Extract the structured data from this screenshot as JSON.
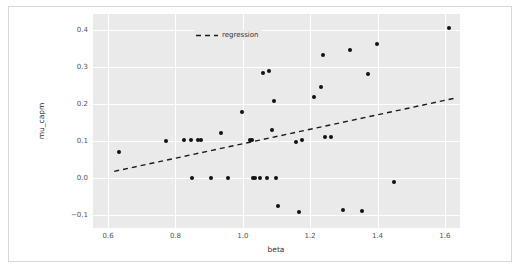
{
  "figure": {
    "background_color": "#ffffff",
    "axes_background_color": "#eaeaea",
    "grid_color": "#ffffff",
    "point_color": "#111111",
    "line_color": "#1a1a1a"
  },
  "legend": {
    "position": "upper-left",
    "entries": [
      {
        "label": "regression",
        "marker": "dashed-line",
        "color": "#1a1a1a"
      }
    ]
  },
  "chart_data": {
    "type": "scatter",
    "title": "",
    "xlabel": "beta",
    "ylabel": "mu_capm",
    "xlim": [
      0.555,
      1.645
    ],
    "ylim": [
      -0.135,
      0.443
    ],
    "xticks": [
      0.6,
      0.8,
      1.0,
      1.2,
      1.4,
      1.6
    ],
    "xticklabels": [
      "0.6",
      "0.8",
      "1.0",
      "1.2",
      "1.4",
      "1.6"
    ],
    "yticks": [
      -0.1,
      0.0,
      0.1,
      0.2,
      0.3,
      0.4
    ],
    "yticklabels": [
      "−0.1",
      "0.0",
      "0.1",
      "0.2",
      "0.3",
      "0.4"
    ],
    "grid": true,
    "legend_position": "upper left",
    "series": [
      {
        "name": "observations",
        "type": "scatter",
        "color": "#111111",
        "marker": "o",
        "points": [
          [
            0.633,
            0.071
          ],
          [
            0.771,
            0.101
          ],
          [
            0.826,
            0.104
          ],
          [
            0.845,
            0.104
          ],
          [
            0.849,
            0.0
          ],
          [
            0.868,
            0.104
          ],
          [
            0.877,
            0.102
          ],
          [
            0.905,
            0.0
          ],
          [
            0.935,
            0.122
          ],
          [
            0.957,
            0.0
          ],
          [
            0.999,
            0.179
          ],
          [
            1.022,
            0.104
          ],
          [
            1.027,
            0.103
          ],
          [
            1.031,
            0.0
          ],
          [
            1.037,
            0.0
          ],
          [
            1.051,
            0.0
          ],
          [
            1.06,
            0.283
          ],
          [
            1.072,
            0.0
          ],
          [
            1.077,
            0.289
          ],
          [
            1.086,
            0.13
          ],
          [
            1.092,
            0.207
          ],
          [
            1.098,
            0.0
          ],
          [
            1.104,
            -0.075
          ],
          [
            1.159,
            0.098
          ],
          [
            1.166,
            -0.092
          ],
          [
            1.175,
            0.104
          ],
          [
            1.21,
            0.219
          ],
          [
            1.232,
            0.247
          ],
          [
            1.239,
            0.331
          ],
          [
            1.245,
            0.112
          ],
          [
            1.263,
            0.111
          ],
          [
            1.297,
            -0.087
          ],
          [
            1.318,
            0.345
          ],
          [
            1.355,
            -0.088
          ],
          [
            1.372,
            0.281
          ],
          [
            1.399,
            0.361
          ],
          [
            1.448,
            -0.012
          ],
          [
            1.612,
            0.404
          ]
        ]
      },
      {
        "name": "regression",
        "type": "line",
        "style": "dashed",
        "color": "#1a1a1a",
        "endpoints": [
          [
            0.618,
            0.018
          ],
          [
            1.632,
            0.216
          ]
        ],
        "slope": 0.195,
        "intercept": -0.103
      }
    ]
  }
}
